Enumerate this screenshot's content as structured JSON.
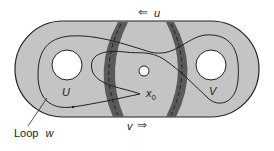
{
  "diagram": {
    "colors": {
      "surface_fill": "#c4c4c4",
      "overlap_band": "#5a5a5a",
      "outline": "#222222",
      "hole": "#ffffff"
    },
    "labels": {
      "u_arrow": "⇐",
      "u": "u",
      "v_arrow": "⇒",
      "v": "v",
      "region_u": "U",
      "region_v": "V",
      "basepoint": "x",
      "basepoint_sub": "0",
      "loop_label": "Loop",
      "loop_var": "w"
    }
  }
}
